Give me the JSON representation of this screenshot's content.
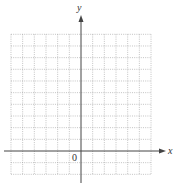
{
  "chart_data": {
    "type": "grid",
    "title": "",
    "xlabel": "x",
    "ylabel": "y",
    "origin_label": "0",
    "grid": true,
    "grid_style": "dotted",
    "columns_left_of_y_axis": 6,
    "columns_right_of_y_axis": 6,
    "rows_above_x_axis": 10,
    "rows_below_x_axis": 2,
    "xlim": [
      -6,
      6
    ],
    "ylim": [
      -2,
      10
    ],
    "tick_labels": []
  },
  "colors": {
    "axis": "#444444",
    "grid": "#9a9a9a",
    "background": "#ffffff"
  }
}
